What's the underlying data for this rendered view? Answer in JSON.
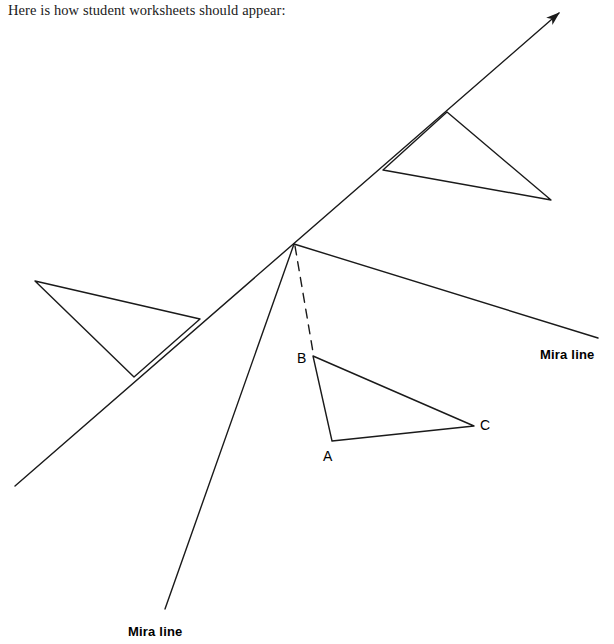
{
  "caption": "Here is how student worksheets should appear:",
  "figure": {
    "background": "#ffffff",
    "ink_color": "#1a1a1a",
    "stroke_width": 1.4,
    "mira_lines": [
      {
        "name": "diagonal-mira-line",
        "label": "Mira line",
        "label_x": 540,
        "label_y": 347,
        "from_x": 15,
        "from_y": 486,
        "to_x": 559,
        "to_y": 13,
        "arrowhead": "end",
        "note": "runs lower-left to upper-right with arrow at top"
      },
      {
        "name": "steep-mira-line",
        "label": "Mira line",
        "label_x": 128,
        "label_y": 624,
        "from_x": 294,
        "from_y": 244,
        "to_x": 165,
        "to_y": 609,
        "arrowhead": "none",
        "note": "steep line descending to lower-left, ends above its label"
      }
    ],
    "ray_right": {
      "name": "right-ray",
      "from_x": 294,
      "from_y": 244,
      "to_x": 598,
      "to_y": 338
    },
    "intersection": {
      "x": 294,
      "y": 244
    },
    "dashed_segment": {
      "name": "dashed-construction-line",
      "from_x": 295,
      "from_y": 246,
      "to_x": 313,
      "to_y": 352,
      "dash": "9 7"
    },
    "triangles": [
      {
        "name": "triangle-abc",
        "points": "313,356 332,441 474,426",
        "labeled": true,
        "vertices": [
          {
            "label": "B",
            "x": 313,
            "y": 356,
            "label_x": 297,
            "label_y": 350
          },
          {
            "label": "A",
            "x": 332,
            "y": 441,
            "label_x": 323,
            "label_y": 448
          },
          {
            "label": "C",
            "x": 474,
            "y": 426,
            "label_x": 480,
            "label_y": 417
          }
        ]
      },
      {
        "name": "triangle-reflected-upper-right",
        "points": "447,112 383,170 551,200",
        "labeled": false
      },
      {
        "name": "triangle-reflected-left",
        "points": "35,281 200,319 134,377",
        "labeled": false
      }
    ]
  }
}
